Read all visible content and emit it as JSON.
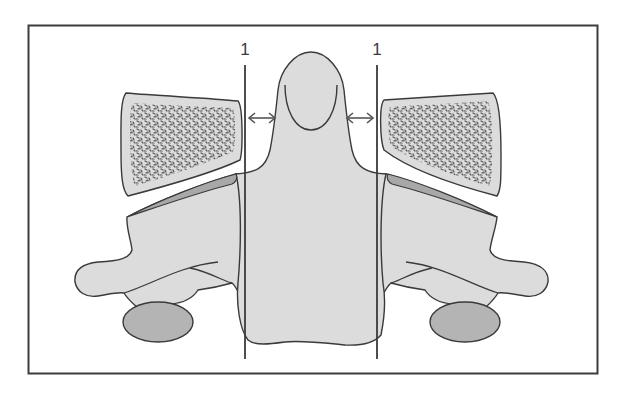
{
  "diagram": {
    "type": "anatomical-illustration",
    "colors": {
      "background": "#ffffff",
      "frame": "#3c3c3c",
      "outline": "#3a3a3a",
      "bone_fill": "#dcdcdc",
      "facet_fill": "#a8a8a8",
      "oval_fill": "#b4b4b4",
      "stipple": "#555555"
    },
    "labels": [
      {
        "id": "left-line-label",
        "text": "1",
        "x": 245,
        "y": 50
      },
      {
        "id": "right-line-label",
        "text": "1",
        "x": 377,
        "y": 50
      }
    ],
    "reference_lines": [
      {
        "id": "left",
        "x": 245,
        "y1": 65,
        "y2": 359
      },
      {
        "id": "right",
        "x": 377,
        "y1": 65,
        "y2": 359
      }
    ],
    "arrows": [
      {
        "id": "left-gap-arrow",
        "x1": 247,
        "x2": 277,
        "y": 118,
        "style": "double-headed"
      },
      {
        "id": "right-gap-arrow",
        "x1": 345,
        "x2": 375,
        "y": 118,
        "style": "double-headed"
      }
    ]
  }
}
